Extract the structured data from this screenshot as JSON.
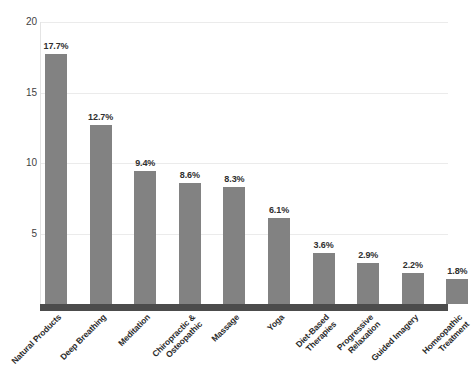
{
  "chart_data": {
    "type": "bar",
    "title": "",
    "subtitle": "",
    "xlabel": "",
    "ylabel": "",
    "ylim": [
      0,
      20
    ],
    "grid": true,
    "legend": false,
    "legend_position": "none",
    "yticks": [
      "20",
      "15",
      "10",
      "5"
    ],
    "ytick_values": [
      20,
      15,
      10,
      5
    ],
    "categories": [
      "Natural Products",
      "Deep Breathing",
      "Chiropractic &\nOsteopathic",
      "Meditation",
      "Massage",
      "Yoga",
      "Diet-Based\nTherapies",
      "Progressive\nRelaxation",
      "Guided Imagery",
      "Homeopathic\nTreatment"
    ],
    "categories_ordered": [
      "Natural Products",
      "Deep Breathing",
      "Meditation",
      "Chiropractic &\nOsteopathic",
      "Massage",
      "Yoga",
      "Diet-Based\nTherapies",
      "Progressive\nRelaxation",
      "Guided Imagery",
      "Homeopathic\nTreatment"
    ],
    "values": [
      17.7,
      12.7,
      9.4,
      8.6,
      8.3,
      6.1,
      3.6,
      2.9,
      2.2,
      1.8
    ],
    "data_labels": [
      "17.7%",
      "12.7%",
      "9.4%",
      "8.6%",
      "8.3%",
      "6.1%",
      "3.6%",
      "2.9%",
      "2.2%",
      "1.8%"
    ],
    "bar_color": "#828282",
    "baseline_color": "#4c4c4c",
    "gridline_color": "#ebebeb",
    "text_color": "#2b2b2b",
    "bars": [
      {
        "label": "Natural Products",
        "label_lines": [
          "Natural Products"
        ],
        "value": 17.7,
        "data_label": "17.7%"
      },
      {
        "label": "Deep Breathing",
        "label_lines": [
          "Deep Breathing"
        ],
        "value": 12.7,
        "data_label": "12.7%"
      },
      {
        "label": "Meditation",
        "label_lines": [
          "Meditation"
        ],
        "value": 9.4,
        "data_label": "9.4%"
      },
      {
        "label": "Chiropractic & Osteopathic",
        "label_lines": [
          "Chiropractic &",
          "Osteopathic"
        ],
        "value": 8.6,
        "data_label": "8.6%"
      },
      {
        "label": "Massage",
        "label_lines": [
          "Massage"
        ],
        "value": 8.3,
        "data_label": "8.3%"
      },
      {
        "label": "Yoga",
        "label_lines": [
          "Yoga"
        ],
        "value": 6.1,
        "data_label": "6.1%"
      },
      {
        "label": "Diet-Based Therapies",
        "label_lines": [
          "Diet-Based",
          "Therapies"
        ],
        "value": 3.6,
        "data_label": "3.6%"
      },
      {
        "label": "Progressive Relaxation",
        "label_lines": [
          "Progressive",
          "Relaxation"
        ],
        "value": 2.9,
        "data_label": "2.9%"
      },
      {
        "label": "Guided Imagery",
        "label_lines": [
          "Guided Imagery"
        ],
        "value": 2.2,
        "data_label": "2.2%"
      },
      {
        "label": "Homeopathic Treatment",
        "label_lines": [
          "Homeopathic",
          "Treatment"
        ],
        "value": 1.8,
        "data_label": "1.8%"
      }
    ]
  }
}
